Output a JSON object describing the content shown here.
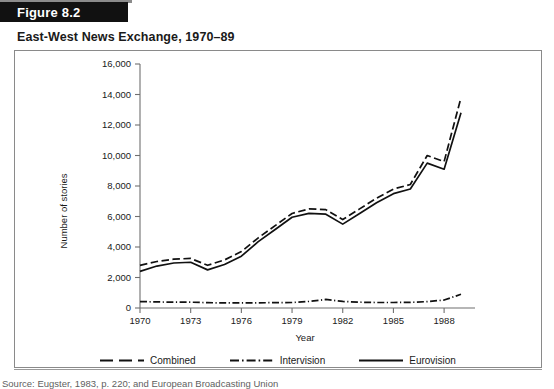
{
  "figure": {
    "badge_label": "Figure 8.2",
    "title": "East-West News Exchange, 1970–89",
    "source": "Source: Eugster, 1983, p. 220; and European Broadcasting Union"
  },
  "legend": {
    "items": [
      {
        "label": "Combined",
        "style": "dashed",
        "icon": "line-dashed-icon"
      },
      {
        "label": "Intervision",
        "style": "dash-dot",
        "icon": "line-dash-dot-icon"
      },
      {
        "label": "Eurovision",
        "style": "solid",
        "icon": "line-solid-icon"
      }
    ]
  },
  "chart_data": {
    "type": "line",
    "title": "East-West News Exchange, 1970–89",
    "xlabel": "Year",
    "ylabel": "Number of stories",
    "xlim": [
      1970,
      1989
    ],
    "ylim": [
      0,
      16000
    ],
    "ytick_labels": [
      "0",
      "2,000",
      "4,000",
      "6,000",
      "8,000",
      "10,000",
      "12,000",
      "14,000",
      "16,000"
    ],
    "yticks": [
      0,
      2000,
      4000,
      6000,
      8000,
      10000,
      12000,
      14000,
      16000
    ],
    "xtick_labels": [
      "1970",
      "1973",
      "1976",
      "1979",
      "1982",
      "1985",
      "1988"
    ],
    "xticks": [
      1970,
      1973,
      1976,
      1979,
      1982,
      1985,
      1988
    ],
    "grid": false,
    "legend_position": "below",
    "x": [
      1970,
      1971,
      1972,
      1973,
      1974,
      1975,
      1976,
      1977,
      1978,
      1979,
      1980,
      1981,
      1982,
      1983,
      1984,
      1985,
      1986,
      1987,
      1988,
      1989
    ],
    "series": [
      {
        "name": "Combined",
        "style": "dashed",
        "values": [
          2800,
          3050,
          3200,
          3250,
          2800,
          3150,
          3700,
          4600,
          5400,
          6200,
          6500,
          6450,
          5800,
          6500,
          7200,
          7800,
          8100,
          10000,
          9600,
          13800
        ]
      },
      {
        "name": "Intervision",
        "style": "dash-dot",
        "values": [
          420,
          400,
          380,
          380,
          350,
          330,
          330,
          340,
          350,
          360,
          430,
          560,
          430,
          380,
          360,
          360,
          370,
          420,
          520,
          900
        ]
      },
      {
        "name": "Eurovision",
        "style": "solid",
        "values": [
          2400,
          2750,
          2950,
          3000,
          2500,
          2850,
          3400,
          4350,
          5150,
          5950,
          6200,
          6150,
          5500,
          6200,
          6900,
          7500,
          7800,
          9500,
          9100,
          12800
        ]
      }
    ]
  }
}
